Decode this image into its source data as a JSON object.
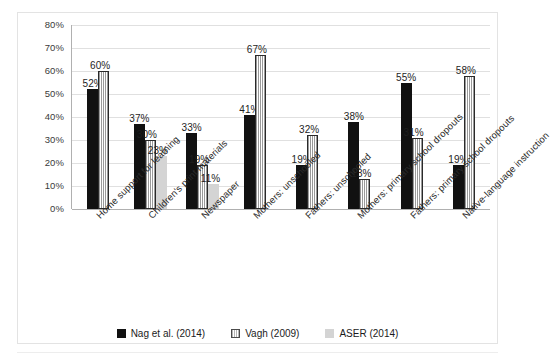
{
  "chart_data": {
    "type": "bar",
    "title": "",
    "subtitle": "",
    "xlabel": "",
    "ylabel": "",
    "ylim": [
      0,
      80
    ],
    "ytick_labels": [
      "0%",
      "10%",
      "20%",
      "30%",
      "40%",
      "50%",
      "60%",
      "70%",
      "80%"
    ],
    "ytick_values": [
      0,
      10,
      20,
      30,
      40,
      50,
      60,
      70,
      80
    ],
    "grid": true,
    "legend_position": "bottom-center",
    "value_suffix": "%",
    "categories": [
      "Home support for learning",
      "Children's print materials",
      "Newspaper",
      "Mothers: unschooled",
      "Fathers: unschooled",
      "Mothers: primary school dropouts",
      "Fathers: primary school dropouts",
      "Native-language instruction"
    ],
    "series": [
      {
        "name": "Nag et al. (2014)",
        "key": "nag",
        "color": "#111111",
        "values": [
          52,
          37,
          33,
          41,
          19,
          38,
          55,
          19
        ],
        "labels": [
          "52%",
          "37%",
          "33%",
          "41%",
          "19%",
          "38%",
          "55%",
          "19%"
        ]
      },
      {
        "name": "Vagh (2009)",
        "key": "vagh",
        "color": "#ffffff",
        "values": [
          60,
          30,
          19,
          67,
          32,
          13,
          31,
          58
        ],
        "labels": [
          "60%",
          "30%",
          "19%",
          "67%",
          "32%",
          "13%",
          "31%",
          "58%"
        ]
      },
      {
        "name": "ASER (2014)",
        "key": "aser",
        "color": "#d4d4d4",
        "values": [
          null,
          23,
          11,
          null,
          null,
          null,
          null,
          null
        ],
        "labels": [
          "",
          "23%",
          "11%",
          "",
          "",
          "",
          "",
          ""
        ]
      }
    ]
  },
  "legend": {
    "items": [
      {
        "label": "Nag et al. (2014)",
        "swatch": "nag"
      },
      {
        "label": "Vagh (2009)",
        "swatch": "vagh"
      },
      {
        "label": "ASER (2014)",
        "swatch": "aser"
      }
    ]
  }
}
